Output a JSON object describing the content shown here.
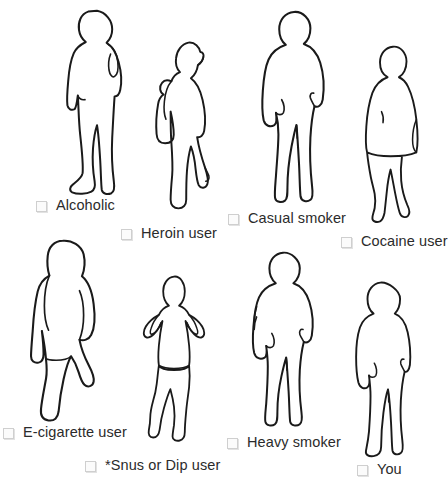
{
  "page": {
    "background_color": "#ffffff",
    "outline_color": "#1a1a1a",
    "text_color": "#2b2b2b",
    "checkbox_border_color": "#cfcfcf",
    "width": 448,
    "height": 483
  },
  "options": [
    {
      "id": "alcoholic",
      "label": "Alcoholic",
      "checkbox": "unchecked-checkbox",
      "figure": "man-hand-on-hip-silhouette"
    },
    {
      "id": "heroin-user",
      "label": "Heroin user",
      "checkbox": "unchecked-checkbox",
      "figure": "thin-woman-with-bag-silhouette"
    },
    {
      "id": "casual-smoker",
      "label": "Casual smoker",
      "checkbox": "unchecked-checkbox",
      "figure": "stocky-man-standing-silhouette"
    },
    {
      "id": "cocaine-user",
      "label": "Cocaine user",
      "checkbox": "unchecked-checkbox",
      "figure": "woman-in-coat-walking-silhouette"
    },
    {
      "id": "e-cigarette-user",
      "label": "E-cigarette user",
      "checkbox": "unchecked-checkbox",
      "figure": "woman-from-behind-silhouette"
    },
    {
      "id": "snus-or-dip-user",
      "label": "*Snus or Dip user",
      "checkbox": "unchecked-checkbox",
      "figure": "woman-hands-on-hips-silhouette"
    },
    {
      "id": "heavy-smoker",
      "label": "Heavy smoker",
      "checkbox": "unchecked-checkbox",
      "figure": "man-standing-silhouette"
    },
    {
      "id": "you",
      "label": "You",
      "checkbox": "unchecked-checkbox",
      "figure": "man-turned-standing-silhouette"
    }
  ]
}
